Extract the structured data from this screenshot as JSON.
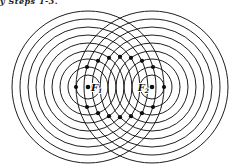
{
  "caption": {
    "text": "y Steps 1-3."
  },
  "figure": {
    "background": "#ffffff",
    "line_color": "#1f1f1f",
    "line_width": 1,
    "dot_color": "#0d0d0d",
    "dot_radius": 2.1,
    "focus_dot_radius": 2.3,
    "centers": [
      {
        "name": "focus-1",
        "x": 88,
        "y": 87
      },
      {
        "name": "focus-2",
        "x": 152,
        "y": 87
      }
    ],
    "radii": [
      12,
      20,
      28,
      36,
      44,
      52,
      60,
      68,
      76
    ],
    "foci_dots": [
      {
        "x": 88,
        "y": 87
      },
      {
        "x": 152,
        "y": 87
      }
    ],
    "ellipse_dots": [
      {
        "x": 76,
        "y": 87
      },
      {
        "x": 87,
        "y": 67
      },
      {
        "x": 87,
        "y": 107
      },
      {
        "x": 98,
        "y": 60.8
      },
      {
        "x": 98,
        "y": 113.2
      },
      {
        "x": 109,
        "y": 57.8
      },
      {
        "x": 109,
        "y": 116.2
      },
      {
        "x": 120,
        "y": 56.8
      },
      {
        "x": 120,
        "y": 117.2
      },
      {
        "x": 131,
        "y": 57.8
      },
      {
        "x": 131,
        "y": 116.2
      },
      {
        "x": 142,
        "y": 60.8
      },
      {
        "x": 142,
        "y": 113.2
      },
      {
        "x": 153,
        "y": 67
      },
      {
        "x": 153,
        "y": 107
      },
      {
        "x": 164,
        "y": 87
      }
    ],
    "labels": [
      {
        "text": "F",
        "sub": "1",
        "x": 91,
        "y": 91,
        "anchor": "start"
      },
      {
        "text": "F",
        "sub": "2",
        "x": 149,
        "y": 91,
        "anchor": "end"
      }
    ]
  }
}
